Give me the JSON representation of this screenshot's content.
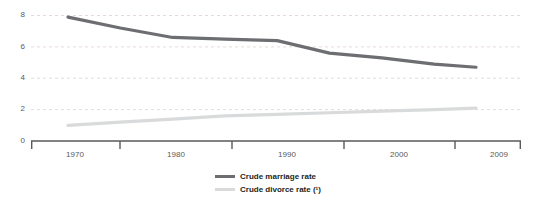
{
  "chart_data": {
    "type": "line",
    "title": "",
    "subtitle": "",
    "xlabel": "",
    "ylabel": "",
    "xlim": [
      1968,
      2011
    ],
    "ylim": [
      0,
      8
    ],
    "x_ticks": [
      1970,
      1980,
      1990,
      2000,
      2009
    ],
    "y_ticks": [
      0,
      2,
      4,
      6,
      8
    ],
    "grid": "horizontal-dotted",
    "legend_position": "bottom-center",
    "series": [
      {
        "name": "Crude marriage rate",
        "color": "#6d6e71",
        "x": [
          1970,
          1975,
          1980,
          1985,
          1990,
          1995,
          2000,
          2005,
          2009
        ],
        "values": [
          7.9,
          7.2,
          6.6,
          6.5,
          6.4,
          5.6,
          5.3,
          4.9,
          4.7
        ]
      },
      {
        "name": "Crude divorce rate (¹)",
        "color": "#d9dadb",
        "x": [
          1970,
          1975,
          1980,
          1985,
          1990,
          1995,
          2000,
          2005,
          2009
        ],
        "values": [
          1.0,
          1.2,
          1.4,
          1.6,
          1.7,
          1.8,
          1.9,
          2.0,
          2.1
        ]
      }
    ]
  },
  "axes": {
    "y_labels": [
      "8",
      "6",
      "4",
      "2",
      "0"
    ],
    "x_labels": [
      "1970",
      "1980",
      "1990",
      "2000",
      "2009"
    ]
  },
  "legend": {
    "items": [
      {
        "label": "Crude marriage rate",
        "color": "#6d6e71"
      },
      {
        "label": "Crude divorce rate (¹)",
        "color": "#d9dadb"
      }
    ]
  },
  "colors": {
    "marriage_line": "#6d6e71",
    "divorce_line": "#d9dadb",
    "axis": "#58595b",
    "gridline": "#e8d9d9",
    "tick_text": "#58595b",
    "legend_text": "#231f20",
    "background": "#ffffff"
  }
}
